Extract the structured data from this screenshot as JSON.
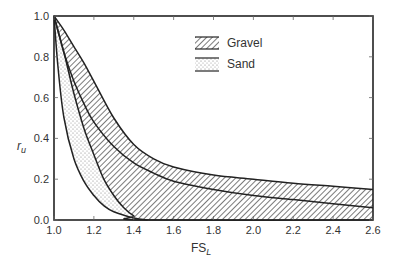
{
  "chart_data": {
    "type": "area",
    "title": "",
    "xlabel": "FS",
    "xlabel_subscript": "L",
    "ylabel": "r",
    "ylabel_subscript": "u",
    "xlim": [
      1.0,
      2.6
    ],
    "ylim": [
      0.0,
      1.0
    ],
    "x_ticks": [
      "1.0",
      "1.2",
      "1.4",
      "1.6",
      "1.8",
      "2.0",
      "2.2",
      "2.4",
      "2.6"
    ],
    "y_ticks": [
      "0.0",
      "0.2",
      "0.4",
      "0.6",
      "0.8",
      "1.0"
    ],
    "grid": false,
    "legend_position": "upper center",
    "legend": [
      {
        "label": "Gravel",
        "pattern": "diagonal-hatch"
      },
      {
        "label": "Sand",
        "pattern": "stipple"
      }
    ],
    "series": [
      {
        "name": "Gravel upper bound",
        "x": [
          1.0,
          1.05,
          1.1,
          1.15,
          1.2,
          1.3,
          1.4,
          1.5,
          1.6,
          1.8,
          2.0,
          2.2,
          2.4,
          2.6
        ],
        "values": [
          1.0,
          0.93,
          0.85,
          0.77,
          0.68,
          0.5,
          0.37,
          0.3,
          0.26,
          0.22,
          0.2,
          0.18,
          0.165,
          0.15
        ]
      },
      {
        "name": "Gravel middle curve",
        "x": [
          1.0,
          1.05,
          1.1,
          1.15,
          1.2,
          1.3,
          1.4,
          1.5,
          1.6,
          1.8,
          2.0,
          2.2,
          2.4,
          2.6
        ],
        "values": [
          1.0,
          0.82,
          0.68,
          0.57,
          0.48,
          0.36,
          0.28,
          0.23,
          0.19,
          0.15,
          0.12,
          0.1,
          0.08,
          0.06
        ]
      },
      {
        "name": "Gravel lower bound / Sand upper bound",
        "x": [
          1.0,
          1.05,
          1.1,
          1.15,
          1.2,
          1.25,
          1.3,
          1.35,
          1.4,
          1.45,
          2.6
        ],
        "values": [
          1.0,
          0.82,
          0.62,
          0.45,
          0.32,
          0.2,
          0.12,
          0.06,
          0.02,
          0.0,
          0.0
        ]
      },
      {
        "name": "Sand lower bound",
        "x": [
          1.0,
          1.02,
          1.05,
          1.1,
          1.15,
          1.2,
          1.25,
          1.3,
          1.4,
          1.47
        ],
        "values": [
          1.0,
          0.75,
          0.5,
          0.3,
          0.19,
          0.12,
          0.07,
          0.04,
          0.01,
          0.0
        ]
      }
    ]
  }
}
